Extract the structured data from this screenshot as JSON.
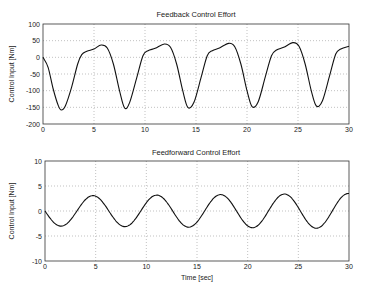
{
  "chart_data": [
    {
      "type": "line",
      "title": "Feedback Control Effort",
      "xlabel": "",
      "ylabel": "Control Input [Nm]",
      "xlim": [
        0,
        30
      ],
      "ylim": [
        -200,
        100
      ],
      "xticks": [
        0,
        5,
        10,
        15,
        20,
        25,
        30
      ],
      "yticks": [
        -200,
        -150,
        -100,
        -50,
        0,
        50,
        100
      ],
      "grid": true,
      "series": [
        {
          "name": "feedback",
          "x": [
            0,
            0.5,
            1.0,
            1.5,
            1.8,
            2.2,
            2.8,
            3.4,
            3.8,
            4.3,
            5.0,
            5.7,
            6.3,
            6.9,
            7.5,
            8.0,
            8.5,
            9.2,
            9.8,
            10.3,
            11.0,
            11.9,
            12.5,
            13.1,
            13.7,
            14.2,
            14.8,
            15.5,
            16.1,
            16.6,
            17.3,
            18.2,
            18.8,
            19.4,
            20.0,
            20.5,
            21.1,
            21.8,
            22.4,
            22.9,
            23.6,
            24.5,
            25.1,
            25.7,
            26.3,
            26.8,
            27.4,
            28.1,
            28.7,
            29.2,
            30.0
          ],
          "y": [
            0,
            -30,
            -95,
            -145,
            -158,
            -145,
            -90,
            -20,
            8,
            18,
            25,
            37,
            28,
            -20,
            -100,
            -152,
            -135,
            -60,
            5,
            20,
            27,
            40,
            30,
            -20,
            -100,
            -150,
            -135,
            -60,
            5,
            20,
            28,
            42,
            32,
            -20,
            -100,
            -148,
            -133,
            -58,
            5,
            22,
            30,
            44,
            33,
            -20,
            -100,
            -146,
            -130,
            -55,
            10,
            25,
            33
          ]
        }
      ]
    },
    {
      "type": "line",
      "title": "Feedforward Control Effort",
      "xlabel": "Time [sec]",
      "ylabel": "Control Input [Nm]",
      "xlim": [
        0,
        30
      ],
      "ylim": [
        -10,
        10
      ],
      "xticks": [
        0,
        5,
        10,
        15,
        20,
        25,
        30
      ],
      "yticks": [
        -10,
        -5,
        0,
        5,
        10
      ],
      "grid": true,
      "series": [
        {
          "name": "feedforward",
          "function": "-A(t)*sin(2*pi*t/6.3), A grows ~3.0 to ~3.5",
          "x": [
            0,
            1.6,
            3.1,
            4.7,
            6.3,
            7.9,
            9.5,
            11.0,
            12.6,
            14.2,
            15.8,
            17.3,
            18.9,
            20.5,
            22.1,
            23.6,
            25.2,
            26.8,
            28.4,
            30.0
          ],
          "y": [
            0,
            -3.0,
            0,
            3.1,
            0,
            -3.0,
            0,
            3.2,
            0,
            -2.9,
            0,
            3.3,
            0,
            -2.8,
            0,
            3.4,
            0,
            -2.7,
            0,
            3.5
          ]
        }
      ]
    }
  ]
}
